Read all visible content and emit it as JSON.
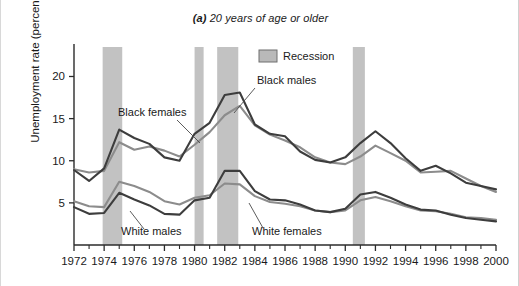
{
  "figure": {
    "title_lead": "(a)",
    "title_rest": " 20 years of age or older",
    "background": "#ffffff"
  },
  "axes": {
    "ylabel": "Unemployment rate (percent)",
    "xlabel": "",
    "ytick_labels": [
      "5",
      "10",
      "15",
      "20"
    ],
    "xtick_labels": [
      "1972",
      "1974",
      "1976",
      "1978",
      "1980",
      "1982",
      "1984",
      "1986",
      "1988",
      "1990",
      "1992",
      "1994",
      "1996",
      "1998",
      "2000"
    ]
  },
  "legend": {
    "position": "top-center",
    "entries": [
      {
        "label": "Recession",
        "swatch_color": "#b9b9b9",
        "swatch_border": "#6f6f6f"
      }
    ]
  },
  "annotations": [
    {
      "name": "black-males",
      "text": "Black males",
      "x": 256,
      "y": 84
    },
    {
      "name": "black-females",
      "text": "Black females",
      "x": 117,
      "y": 116
    },
    {
      "name": "white-males",
      "text": "White males",
      "x": 120,
      "y": 235
    },
    {
      "name": "white-females",
      "text": "White females",
      "x": 251,
      "y": 235
    }
  ],
  "chart_data": {
    "type": "line",
    "title": "(a) 20 years of age or older",
    "xlabel": "",
    "ylabel": "Unemployment rate (percent)",
    "xlim": [
      1972,
      2000
    ],
    "ylim": [
      0,
      23.5
    ],
    "grid": false,
    "legend_position": "top-center",
    "x": [
      1972,
      1973,
      1974,
      1975,
      1976,
      1977,
      1978,
      1979,
      1980,
      1981,
      1982,
      1983,
      1984,
      1985,
      1986,
      1987,
      1988,
      1989,
      1990,
      1991,
      1992,
      1993,
      1994,
      1995,
      1996,
      1997,
      1998,
      1999,
      2000
    ],
    "series": [
      {
        "name": "Black males",
        "color": "#3d3d3d",
        "width": 2.1,
        "values": [
          8.9,
          7.6,
          9.1,
          13.7,
          12.7,
          12.0,
          10.4,
          10.0,
          13.2,
          14.5,
          17.8,
          18.1,
          14.3,
          13.2,
          12.9,
          11.1,
          10.1,
          9.8,
          10.4,
          12.1,
          13.5,
          12.1,
          10.3,
          8.8,
          9.4,
          8.5,
          7.4,
          7.0,
          6.6
        ]
      },
      {
        "name": "Black females",
        "color": "#8c8c8c",
        "width": 2.1,
        "values": [
          9.0,
          8.6,
          8.8,
          12.2,
          11.3,
          11.7,
          11.2,
          10.5,
          11.9,
          13.4,
          15.4,
          16.5,
          14.2,
          13.1,
          12.4,
          11.6,
          10.4,
          9.8,
          9.6,
          10.5,
          11.8,
          10.9,
          10.0,
          8.6,
          8.7,
          8.8,
          7.9,
          7.0,
          6.3
        ]
      },
      {
        "name": "White males",
        "color": "#3d3d3d",
        "width": 2.1,
        "values": [
          4.5,
          3.7,
          3.8,
          6.2,
          5.4,
          4.7,
          3.7,
          3.6,
          5.3,
          5.6,
          8.8,
          8.8,
          6.4,
          5.4,
          5.3,
          4.8,
          4.1,
          3.9,
          4.3,
          6.0,
          6.3,
          5.6,
          4.8,
          4.2,
          4.1,
          3.6,
          3.2,
          3.0,
          2.8
        ]
      },
      {
        "name": "White females",
        "color": "#8c8c8c",
        "width": 2.1,
        "values": [
          5.2,
          4.6,
          4.5,
          7.5,
          7.0,
          6.3,
          5.2,
          4.8,
          5.6,
          5.9,
          7.3,
          7.2,
          5.8,
          5.1,
          4.9,
          4.6,
          4.1,
          3.9,
          4.1,
          5.3,
          5.7,
          5.2,
          4.6,
          4.1,
          4.0,
          3.7,
          3.3,
          3.2,
          3.0
        ]
      }
    ],
    "recession_bands": [
      {
        "start": 1973.9,
        "end": 1975.2
      },
      {
        "start": 1980.0,
        "end": 1980.6
      },
      {
        "start": 1981.5,
        "end": 1982.9
      },
      {
        "start": 1990.5,
        "end": 1991.3
      }
    ],
    "recession_color": "#c2c2c2"
  }
}
